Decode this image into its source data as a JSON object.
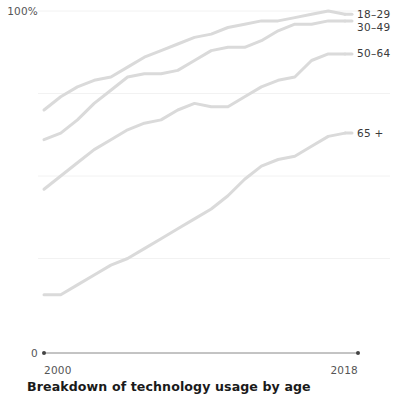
{
  "chart_data": {
    "type": "line",
    "title": "Breakdown of technology usage by age",
    "xlabel": "",
    "ylabel": "",
    "xlim": [
      2000,
      2018
    ],
    "ylim": [
      0,
      100
    ],
    "xticks": [
      "2000",
      "2018"
    ],
    "yticks": [
      "0",
      "100%"
    ],
    "y_axis_top_label": "100%",
    "y_axis_bottom_label": "0",
    "x_axis_start_label": "2000",
    "x_axis_end_label": "2018",
    "grid": true,
    "gridlines_y": [
      100,
      75,
      50,
      25
    ],
    "legend_position": "right-inline",
    "line_color": "#dadada",
    "axis_color": "#888888",
    "grid_color": "#f2f2f2",
    "x": [
      2000,
      2001,
      2002,
      2003,
      2004,
      2005,
      2006,
      2007,
      2008,
      2009,
      2010,
      2011,
      2012,
      2013,
      2014,
      2015,
      2016,
      2017,
      2018
    ],
    "series": [
      {
        "name": "18-29",
        "label": "18–29",
        "values": [
          70,
          74,
          77,
          79,
          80,
          83,
          86,
          88,
          90,
          92,
          93,
          95,
          96,
          97,
          97,
          98,
          99,
          100,
          99
        ]
      },
      {
        "name": "30-49",
        "label": "30–49",
        "values": [
          61,
          63,
          67,
          72,
          76,
          80,
          81,
          81,
          82,
          85,
          88,
          89,
          89,
          91,
          94,
          96,
          96,
          97,
          97
        ]
      },
      {
        "name": "50-64",
        "label": "50–64",
        "values": [
          46,
          50,
          54,
          58,
          61,
          64,
          66,
          67,
          70,
          72,
          71,
          71,
          74,
          77,
          79,
          80,
          85,
          87,
          87
        ]
      },
      {
        "name": "65+",
        "label": "65 +",
        "values": [
          14,
          14,
          17,
          20,
          23,
          25,
          28,
          31,
          34,
          37,
          40,
          44,
          49,
          53,
          55,
          56,
          59,
          62,
          63
        ]
      }
    ]
  }
}
